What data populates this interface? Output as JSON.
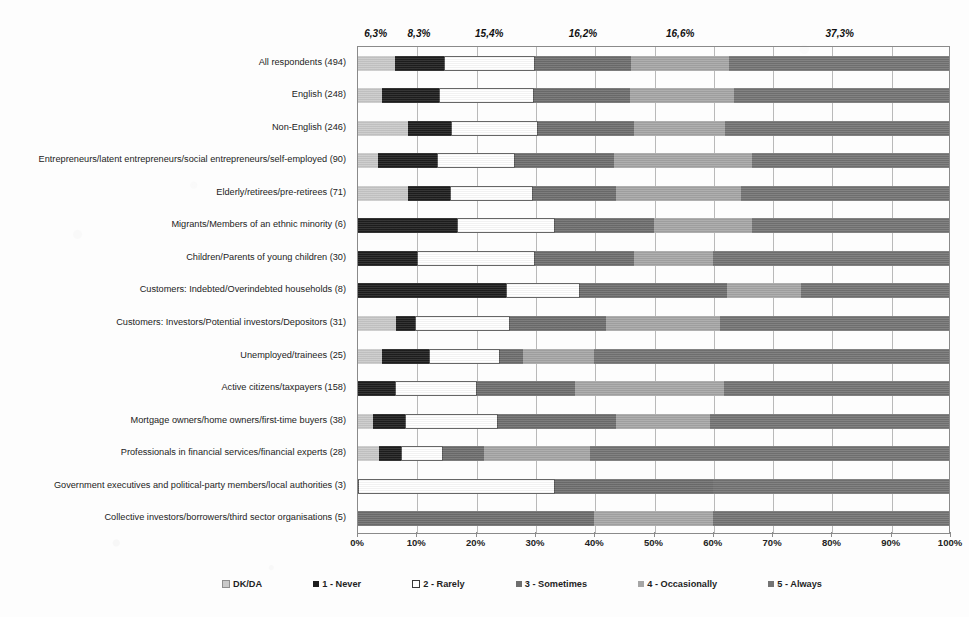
{
  "chart_data": {
    "type": "bar",
    "subtype": "horizontal-stacked-100-percent",
    "title": "",
    "xlabel": "",
    "ylabel": "",
    "xlim": [
      0,
      100
    ],
    "xticks": [
      "0%",
      "10%",
      "20%",
      "30%",
      "40%",
      "50%",
      "60%",
      "70%",
      "80%",
      "90%",
      "100%"
    ],
    "xtick_values": [
      0,
      10,
      20,
      30,
      40,
      50,
      60,
      70,
      80,
      90,
      100
    ],
    "grid": true,
    "legend_position": "bottom",
    "stack_order": [
      "DK/DA",
      "1 - Never",
      "2 - Rarely",
      "3 - Sometimes",
      "4 - Occasionally",
      "5 - Always"
    ],
    "categories": [
      "All respondents (494)",
      "English (248)",
      "Non-English (246)",
      "Entrepreneurs/latent entrepreneurs/social entrepreneurs/self-employed (90)",
      "Elderly/retirees/pre-retirees (71)",
      "Migrants/Members of an ethnic minority (6)",
      "Children/Parents of young children (30)",
      "Customers: Indebted/Overindebted households (8)",
      "Customers: Investors/Potential investors/Depositors (31)",
      "Unemployed/trainees (25)",
      "Active citizens/taxpayers (158)",
      "Mortgage owners/home owners/first-time buyers (38)",
      "Professionals in financial services/financial experts (28)",
      "Government executives and political-party members/local authorities (3)",
      "Collective investors/borrowers/third sector organisations (5)"
    ],
    "series": [
      {
        "name": "DK/DA",
        "values": [
          6.3,
          4.0,
          8.5,
          3.3,
          8.5,
          0.0,
          0.0,
          0.0,
          6.5,
          4.0,
          0.0,
          2.6,
          3.6,
          0.0,
          0.0
        ]
      },
      {
        "name": "1 - Never",
        "values": [
          8.3,
          9.7,
          7.3,
          10.0,
          7.0,
          16.7,
          10.0,
          25.0,
          3.2,
          8.0,
          6.3,
          5.3,
          3.6,
          0.0,
          0.0
        ]
      },
      {
        "name": "2 - Rarely",
        "values": [
          15.4,
          16.1,
          14.6,
          13.3,
          14.1,
          16.7,
          20.0,
          12.5,
          16.1,
          12.0,
          13.9,
          15.8,
          7.1,
          33.3,
          0.0
        ]
      },
      {
        "name": "3 - Sometimes",
        "values": [
          16.2,
          16.1,
          16.3,
          16.7,
          14.1,
          16.7,
          16.7,
          25.0,
          16.1,
          4.0,
          16.5,
          20.0,
          7.1,
          26.7,
          40.0
        ]
      },
      {
        "name": "4 - Occasionally",
        "values": [
          16.6,
          17.7,
          15.4,
          23.3,
          21.1,
          16.7,
          13.3,
          12.5,
          19.4,
          12.0,
          25.3,
          15.8,
          17.9,
          0.0,
          20.0
        ]
      },
      {
        "name": "5 - Always",
        "values": [
          37.3,
          36.3,
          37.8,
          33.3,
          35.2,
          33.3,
          40.0,
          25.0,
          38.7,
          60.0,
          38.0,
          40.5,
          60.7,
          40.0,
          40.0
        ]
      }
    ],
    "annotations": [
      {
        "label": "6,3%",
        "value": 6.3,
        "center": 3.15,
        "series": "DK/DA"
      },
      {
        "label": "8,3%",
        "value": 8.3,
        "center": 10.45,
        "series": "1 - Never"
      },
      {
        "label": "15,4%",
        "value": 15.4,
        "center": 22.3,
        "series": "2 - Rarely"
      },
      {
        "label": "16,2%",
        "value": 16.2,
        "center": 38.1,
        "series": "3 - Sometimes"
      },
      {
        "label": "16,6%",
        "value": 16.6,
        "center": 54.5,
        "series": "4 - Occasionally"
      },
      {
        "label": "37,3%",
        "value": 37.3,
        "center": 81.4,
        "series": "5 - Always"
      }
    ]
  },
  "legend": {
    "items": [
      {
        "label": "DK/DA",
        "swatch": "s0",
        "color": "#c9c9c9"
      },
      {
        "label": "1 - Never",
        "swatch": "s1",
        "color": "#1e1e1e"
      },
      {
        "label": "2 - Rarely",
        "swatch": "s2",
        "color": "#ffffff"
      },
      {
        "label": "3 - Sometimes",
        "swatch": "s3",
        "color": "#6e6e6e"
      },
      {
        "label": "4 - Occasionally",
        "swatch": "s4",
        "color": "#a6a6a6"
      },
      {
        "label": "5 - Always",
        "swatch": "s5",
        "color": "#747474"
      }
    ]
  }
}
